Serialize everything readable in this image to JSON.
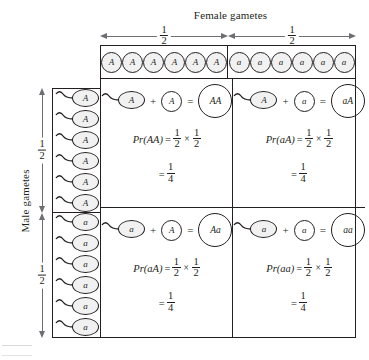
{
  "figure": {
    "type": "punnett-square",
    "female_axis_title": "Female gametes",
    "male_axis_title": "Male gametes",
    "fraction_numerator": "1",
    "fraction_denominator": "2",
    "result_numerator": "1",
    "result_denominator": "4",
    "operators": {
      "plus": "+",
      "equals": "=",
      "times": "×"
    }
  },
  "female_gametes": {
    "column_fractions": [
      "1/2",
      "1/2"
    ],
    "groups": [
      {
        "allele": "A",
        "count": 6,
        "labels": [
          "A",
          "A",
          "A",
          "A",
          "A",
          "A"
        ]
      },
      {
        "allele": "a",
        "count": 6,
        "labels": [
          "a",
          "a",
          "a",
          "a",
          "a",
          "a"
        ]
      }
    ]
  },
  "male_gametes": {
    "row_fractions": [
      "1/2",
      "1/2"
    ],
    "groups": [
      {
        "allele": "A",
        "count": 6,
        "labels": [
          "A",
          "A",
          "A",
          "A",
          "A",
          "A"
        ]
      },
      {
        "allele": "a",
        "count": 6,
        "labels": [
          "a",
          "a",
          "a",
          "a",
          "a",
          "a"
        ]
      }
    ]
  },
  "cells": [
    {
      "position": "top-left",
      "sperm": "A",
      "egg": "A",
      "zygote": "AA",
      "probability_label": "Pr(AA)",
      "factor_one": {
        "num": "1",
        "den": "2"
      },
      "factor_two": {
        "num": "1",
        "den": "2"
      },
      "result": {
        "num": "1",
        "den": "4"
      }
    },
    {
      "position": "top-right",
      "sperm": "A",
      "egg": "a",
      "zygote": "aA",
      "probability_label": "Pr(aA)",
      "factor_one": {
        "num": "1",
        "den": "2"
      },
      "factor_two": {
        "num": "1",
        "den": "2"
      },
      "result": {
        "num": "1",
        "den": "4"
      }
    },
    {
      "position": "bottom-left",
      "sperm": "a",
      "egg": "A",
      "zygote": "Aa",
      "probability_label": "Pr(aA)",
      "factor_one": {
        "num": "1",
        "den": "2"
      },
      "factor_two": {
        "num": "1",
        "den": "2"
      },
      "result": {
        "num": "1",
        "den": "4"
      }
    },
    {
      "position": "bottom-right",
      "sperm": "a",
      "egg": "a",
      "zygote": "aa",
      "probability_label": "Pr(aa)",
      "factor_one": {
        "num": "1",
        "den": "2"
      },
      "factor_two": {
        "num": "1",
        "den": "2"
      },
      "result": {
        "num": "1",
        "den": "4"
      }
    }
  ],
  "colors": {
    "ink": "#231f20",
    "arrow": "#6d6e71",
    "gamete_fill": "#f1f1f2",
    "background": "#ffffff"
  }
}
